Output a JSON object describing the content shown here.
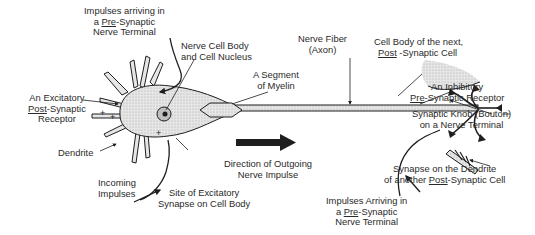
{
  "diagram": {
    "colors": {
      "ink": "#1e1e1e",
      "fill": "#d9d9d9",
      "text": "#2a2a2a",
      "background": "#ffffff"
    },
    "labels": {
      "impulses_top": {
        "l1": "Impulses arriving in",
        "l2a": "a ",
        "l2u": "Pre",
        "l2b": "-Synaptic",
        "l3": "Nerve Terminal"
      },
      "cell_body": {
        "l1": "Nerve Cell Body",
        "l2": "and Cell Nucleus"
      },
      "excitatory_receptor": {
        "l1": "An Excitatory",
        "l2u": "Post",
        "l2b": "-Synaptic",
        "l3": "Receptor"
      },
      "dendrite": {
        "l1": "Dendrite"
      },
      "incoming": {
        "l1": "Incoming",
        "l2": "Impulses"
      },
      "site_synapse": {
        "l1": "Site of Excitatory",
        "l2": "Synapse on Cell Body"
      },
      "myelin": {
        "l1": "A Segment",
        "l2": "of Myelin"
      },
      "axon": {
        "l1": "Nerve Fiber",
        "l2": "(Axon)"
      },
      "direction": {
        "l1": "Direction of Outgoing",
        "l2": "Nerve Impulse"
      },
      "next_cell": {
        "l1": "Cell Body of the next,",
        "l2u": "Post",
        "l2b": " -Synaptic Cell"
      },
      "inhibitory": {
        "l1": "An Inhibitory",
        "l2u": "Pre",
        "l2b": "-Synaptic Receptor"
      },
      "knob": {
        "l1": "Synaptic Knob (Bouton)",
        "l2": "on a Nerve Terminal"
      },
      "synapse_dendrite": {
        "l1": "Synapse on the Dendrite",
        "l2a": "of another ",
        "l2u": "Post",
        "l2b": "-Synaptic Cell"
      },
      "impulses_bottom": {
        "l1": "Impulses Arriving in",
        "l2a": "a ",
        "l2u": "Pre",
        "l2b": "-Synaptic",
        "l3": "Nerve Terminal"
      }
    },
    "signs": {
      "plus": "+",
      "minus": "-"
    }
  }
}
